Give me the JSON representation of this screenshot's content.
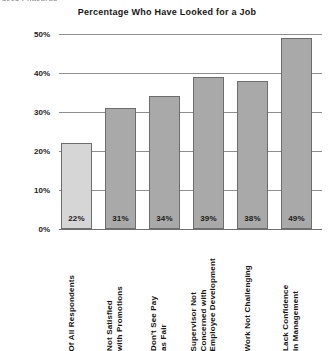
{
  "clipped_fragment": "1998 Phaedrus",
  "chart_data": {
    "type": "bar",
    "title": "Percentage Who Have Looked for a Job",
    "xlabel": "",
    "ylabel": "",
    "ylim": [
      0,
      50
    ],
    "grid": true,
    "legend": "none",
    "ytick_labels": [
      "50%",
      "40%",
      "30%",
      "20%",
      "10%",
      "0%"
    ],
    "ytick_values": [
      50,
      40,
      30,
      20,
      10,
      0
    ],
    "categories": [
      "Of All Respondents",
      "Not Satisfied\nwith Promotions",
      "Don't See Pay\nas Fair",
      "Supervisor Not\nConcerned with\nEmployee Development",
      "Work Not Challenging",
      "Lack Confidence\nin Management"
    ],
    "values": [
      22,
      31,
      34,
      39,
      38,
      49
    ],
    "value_labels": [
      "22%",
      "31%",
      "34%",
      "39%",
      "38%",
      "49%"
    ],
    "bar_colors": [
      "#d6d6d6",
      "#a9a9a9",
      "#a9a9a9",
      "#a9a9a9",
      "#a9a9a9",
      "#a9a9a9"
    ],
    "bar_border_color": "#6d6d6d",
    "gridline_color": "#8e8e8e",
    "background_color": "#ffffff"
  }
}
